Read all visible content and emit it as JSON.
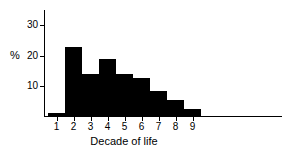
{
  "chart_data": {
    "type": "bar",
    "title": "",
    "subtitle": "",
    "xlabel": "Decade of life",
    "ylabel": "%",
    "categories": [
      "1",
      "2",
      "3",
      "4",
      "5",
      "6",
      "7",
      "8",
      "9"
    ],
    "values": [
      1,
      23,
      14,
      19,
      14,
      12.5,
      8.5,
      5.5,
      2.5
    ],
    "series": [
      {
        "name": "Percent of cases",
        "values": [
          1,
          23,
          14,
          19,
          14,
          12.5,
          8.5,
          5.5,
          2.5
        ]
      }
    ],
    "xtick_labels": [
      "1",
      "2",
      "3",
      "4",
      "5",
      "6",
      "7",
      "8",
      "9"
    ],
    "ytick_labels": [
      "10",
      "20",
      "30"
    ],
    "ytick_values": [
      10,
      20,
      30
    ],
    "ylim": [
      0,
      35
    ],
    "xlim": [
      0.5,
      9.5
    ],
    "grid": false,
    "legend": false,
    "legend_position": "none",
    "bar_color": "#000000",
    "axis_color": "#000000",
    "background_color": "#ffffff",
    "annotations": []
  }
}
